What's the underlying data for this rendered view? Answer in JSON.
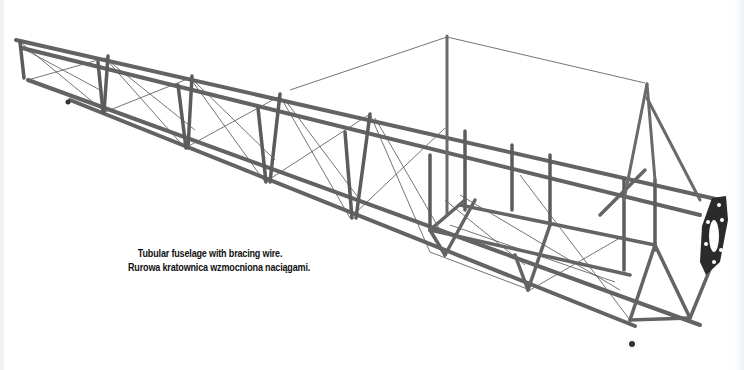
{
  "image": {
    "subject": "tubular-fuselage-truss",
    "background_color": "#ffffff",
    "tube_color": "#6b6b6b",
    "tube_dark_color": "#3a3a3a",
    "wire_color": "#4a4a4a",
    "firewall_color": "#2a2a2a"
  },
  "caption": {
    "line1": "Tubular fuselage with bracing wire.",
    "line2": "Rurowa kratownica wzmocniona naciągami."
  }
}
